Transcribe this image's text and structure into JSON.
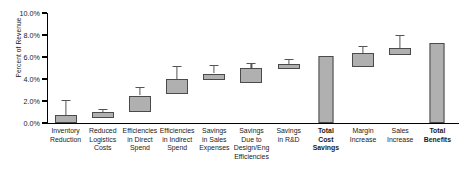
{
  "chart_data": {
    "type": "bar",
    "title": "",
    "xlabel": "",
    "ylabel": "Percent of Revenue",
    "ylim": [
      0,
      10
    ],
    "ytick_labels": [
      "0.0%",
      "2.0%",
      "4.0%",
      "6.0%",
      "8.0%",
      "10.0%"
    ],
    "ytick_values": [
      0,
      2,
      4,
      6,
      8,
      10
    ],
    "grid": false,
    "legend": "none",
    "categories": [
      "Inventory Reduction",
      "Reduced Logistics Costs",
      "Efficiencies in Direct Spend",
      "Efficiencies in Indirect Spend",
      "Savings in Sales Expenses",
      "Savings Due to Design/Eng Efficiencies",
      "Savings in R&D",
      "Total Cost Savings",
      "Margin Increase",
      "Sales Increase",
      "Total Benefits"
    ],
    "category_lines": [
      [
        "Inventory",
        "Reduction"
      ],
      [
        "Reduced",
        "Logistics",
        "Costs"
      ],
      [
        "Efficiencies",
        "in Direct",
        "Spend"
      ],
      [
        "Efficiencies",
        "in Indirect",
        "Spend"
      ],
      [
        "Savings",
        "in Sales",
        "Expenses"
      ],
      [
        "Savings",
        "Due to",
        "Design/Eng",
        "Efficiencies"
      ],
      [
        "Savings",
        "in R&D"
      ],
      [
        "Total",
        "Cost",
        "Savings"
      ],
      [
        "Margin",
        "Increase"
      ],
      [
        "Sales",
        "Increase"
      ],
      [
        "Total",
        "Benefits"
      ]
    ],
    "category_emphasis": [
      false,
      false,
      false,
      false,
      false,
      false,
      false,
      true,
      false,
      false,
      true
    ],
    "series": [
      {
        "name": "Range (box) with upper whisker",
        "points": [
          {
            "category": "Inventory Reduction",
            "box_low": 0.0,
            "box_high": 0.7,
            "whisker_high": 2.1,
            "style": "box"
          },
          {
            "category": "Reduced Logistics Costs",
            "box_low": 0.5,
            "box_high": 1.0,
            "whisker_high": 1.3,
            "style": "box"
          },
          {
            "category": "Efficiencies in Direct Spend",
            "box_low": 1.0,
            "box_high": 2.5,
            "whisker_high": 3.3,
            "style": "box"
          },
          {
            "category": "Efficiencies in Indirect Spend",
            "box_low": 2.6,
            "box_high": 4.0,
            "whisker_high": 5.2,
            "style": "box"
          },
          {
            "category": "Savings in Sales Expenses",
            "box_low": 3.9,
            "box_high": 4.5,
            "whisker_high": 5.3,
            "style": "box"
          },
          {
            "category": "Savings Due to Design/Eng Efficiencies",
            "box_low": 3.6,
            "box_high": 5.0,
            "whisker_high": 5.5,
            "style": "box"
          },
          {
            "category": "Savings in R&D",
            "box_low": 4.9,
            "box_high": 5.4,
            "whisker_high": 5.8,
            "style": "box"
          },
          {
            "category": "Total Cost Savings",
            "value": 6.05,
            "style": "solid"
          },
          {
            "category": "Margin Increase",
            "box_low": 5.1,
            "box_high": 6.4,
            "whisker_high": 7.0,
            "style": "box"
          },
          {
            "category": "Sales Increase",
            "box_low": 6.2,
            "box_high": 6.8,
            "whisker_high": 8.0,
            "style": "box"
          },
          {
            "category": "Total Benefits",
            "value": 7.3,
            "style": "solid"
          }
        ]
      }
    ],
    "colors": {
      "bar_fill": "#b0b0b0",
      "bar_stroke": "#4a4a4a",
      "axis": "#000000",
      "text": "#1a1a1a",
      "background": "#ffffff"
    }
  }
}
